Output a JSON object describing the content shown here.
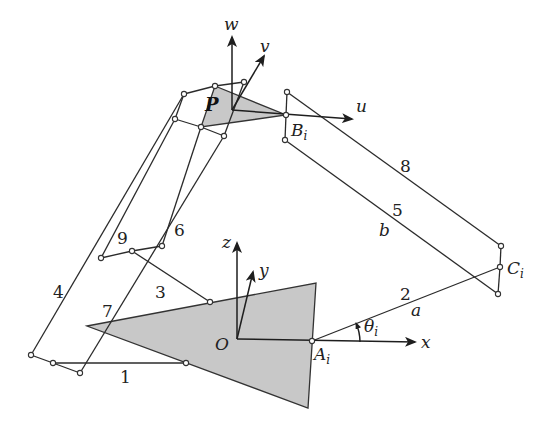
{
  "figure": {
    "type": "parallel-manipulator-kinematic-diagram",
    "colors": {
      "background": "#ffffff",
      "platform_fill": "#c8c8c8",
      "line": "#2b2b2b"
    }
  },
  "moving_platform": {
    "label": "P",
    "frame_axes": {
      "u": "u",
      "v": "v",
      "w": "w"
    },
    "attach_point": {
      "label": "B",
      "subscript": "i"
    }
  },
  "base_platform": {
    "origin_label": "O",
    "frame_axes": {
      "x": "x",
      "y": "y",
      "z": "z"
    },
    "attach_point": {
      "label": "A",
      "subscript": "i"
    }
  },
  "joint_C": {
    "label": "C",
    "subscript": "i"
  },
  "angle": {
    "symbol": "θ",
    "subscript": "i"
  },
  "link_lengths": {
    "a": "a",
    "b": "b"
  },
  "link_numbers": [
    "1",
    "2",
    "3",
    "4",
    "5",
    "6",
    "7",
    "8",
    "9"
  ]
}
